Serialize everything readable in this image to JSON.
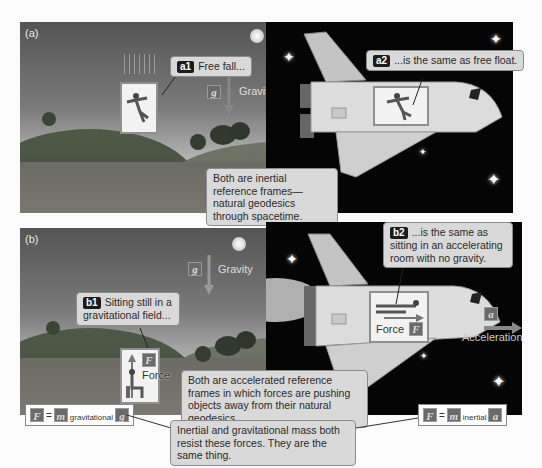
{
  "panel_a": {
    "label": "(a)",
    "callout_a1": {
      "tag": "a1",
      "text": "Free fall..."
    },
    "callout_a2": {
      "tag": "a2",
      "text": "...is the same as free float."
    },
    "gravity_symbol": "g",
    "gravity_label": "Gravity",
    "summary": "Both are inertial reference frames—natural geodesics through spacetime."
  },
  "panel_b": {
    "label": "(b)",
    "callout_b1": {
      "tag": "b1",
      "text": "Sitting still in a gravitational field..."
    },
    "callout_b2": {
      "tag": "b2",
      "text": "...is the same as sitting in an accelerating room with no gravity."
    },
    "gravity_symbol": "g",
    "gravity_label": "Gravity",
    "force_symbol": "F",
    "force_label": "Force",
    "accel_symbol": "a",
    "accel_label": "Acceleration",
    "summary": "Both are accelerated reference frames in which forces are pushing objects away from their natural geodesics."
  },
  "equations": {
    "gravitational": {
      "lhs": "F",
      "eq": "=",
      "m": "m",
      "sub": "gravitational",
      "rhs": "g"
    },
    "inertial": {
      "lhs": "F",
      "eq": "=",
      "m": "m",
      "sub": "inertial",
      "rhs": "a"
    }
  },
  "conclusion": "Inertial and gravitational mass both resist these forces. They are the same thing."
}
